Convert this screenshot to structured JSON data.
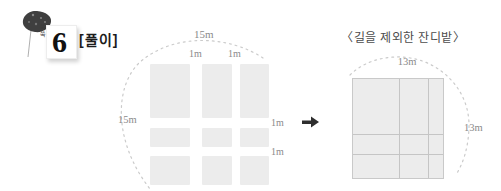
{
  "header": {
    "badge_tiny_label": "쑥쑥",
    "badge_number": "6",
    "solution_label": "[풀이]"
  },
  "left_figure": {
    "top_width_label": "15m",
    "left_height_label": "15m",
    "top_path_labels": [
      "1m",
      "1m"
    ],
    "right_path_labels": [
      "1m",
      "1m"
    ]
  },
  "right_figure": {
    "caption": "〈길을 제외한 잔디밭〉",
    "top_width_label": "13m",
    "right_height_label": "13m"
  },
  "icons": {
    "balloon_icon": "dark-balloon-on-string",
    "arrow_icon": "right-arrow"
  },
  "colors": {
    "lawn_fill": "#ececec",
    "square_border": "#c9c9c9",
    "grid_line": "#c5c5c5",
    "dotted_arc": "#cbcbcb",
    "measure_label": "#8a8a8a",
    "caption_text": "#4c4c4c",
    "arrow": "#2e2e2e",
    "header_text": "#1c1c1c"
  }
}
